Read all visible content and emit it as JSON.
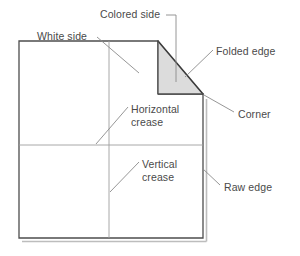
{
  "figure": {
    "colors": {
      "paper_fill": "#ffffff",
      "paper_stroke": "#4d4d4d",
      "colored_side_fill": "#dcdcdc",
      "fold_stroke": "#3a3a3a",
      "crease_stroke": "#9a9a9a",
      "leader_stroke": "#8a8a8a",
      "shadow_stroke": "#b8b8b8",
      "text": "#4a4a4a",
      "background": "#ffffff"
    },
    "geometry": {
      "paper_top_left": [
        19,
        41
      ],
      "paper_bottom_left": [
        19,
        238
      ],
      "paper_bottom_right": [
        203,
        238
      ],
      "fold_top_point": [
        158,
        41
      ],
      "fold_inner_corner": [
        158,
        94
      ],
      "fold_corner_point": [
        203,
        94
      ],
      "horizontal_crease_y": 145,
      "vertical_crease_x": 109
    }
  },
  "labels": {
    "colored_side": {
      "text": "Colored side",
      "x": 100,
      "y": 8
    },
    "white_side": {
      "text": "White side",
      "x": 37,
      "y": 30
    },
    "folded_edge": {
      "text": "Folded edge",
      "x": 216,
      "y": 45
    },
    "corner": {
      "text": "Corner",
      "x": 238,
      "y": 108
    },
    "horizontal_crease": {
      "line1": "Horizontal",
      "line2": "crease",
      "x": 131,
      "y": 103
    },
    "vertical_crease": {
      "line1": "Vertical",
      "line2": "crease",
      "x": 142,
      "y": 158
    },
    "raw_edge": {
      "text": "Raw edge",
      "x": 224,
      "y": 181
    }
  }
}
